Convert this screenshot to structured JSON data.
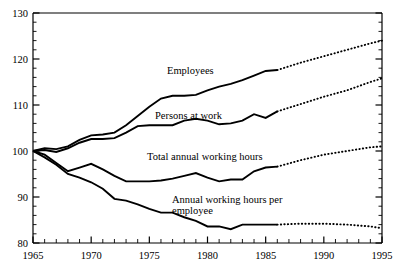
{
  "chart_data": {
    "type": "line",
    "title": "",
    "subtitle": "",
    "xlabel": "",
    "ylabel": "",
    "xlim": [
      1965,
      1995
    ],
    "ylim": [
      80,
      130
    ],
    "grid": false,
    "legend_position": "inline-annotations",
    "y_ticks_major": [
      80,
      90,
      100,
      110,
      120,
      130
    ],
    "y_ticks_minor_step": 2,
    "x_ticks_major": [
      1965,
      1970,
      1975,
      1980,
      1985,
      1990,
      1995
    ],
    "x_ticks_minor_step": 1,
    "x_tick_labels": [
      "1965",
      "1970",
      "1975",
      "1980",
      "1985",
      "1990",
      "1995"
    ],
    "y_tick_labels": [
      "80",
      "90",
      "100",
      "110",
      "120",
      "130"
    ],
    "index_base_note": "1965 = 100",
    "series": [
      {
        "name": "Employees",
        "label": "Employees",
        "style": "solid-then-dotted",
        "forecast_starts": 1986,
        "x": [
          1965,
          1966,
          1967,
          1968,
          1969,
          1970,
          1971,
          1972,
          1973,
          1974,
          1975,
          1976,
          1977,
          1978,
          1979,
          1980,
          1981,
          1982,
          1983,
          1984,
          1985,
          1986
        ],
        "values": [
          100.0,
          100.6,
          100.4,
          101.0,
          102.4,
          103.4,
          103.6,
          104.0,
          105.6,
          107.6,
          109.6,
          111.4,
          112.0,
          112.0,
          112.2,
          113.2,
          114.0,
          114.6,
          115.4,
          116.4,
          117.4,
          117.6
        ],
        "forecast_x": [
          1986,
          1988,
          1990,
          1992,
          1994,
          1995
        ],
        "forecast_values": [
          117.6,
          119.2,
          120.6,
          122.0,
          123.4,
          124.0
        ]
      },
      {
        "name": "Persons at work",
        "label": "Persons at work",
        "style": "solid-then-dotted",
        "forecast_starts": 1986,
        "x": [
          1965,
          1966,
          1967,
          1968,
          1969,
          1970,
          1971,
          1972,
          1973,
          1974,
          1975,
          1976,
          1977,
          1978,
          1979,
          1980,
          1981,
          1982,
          1983,
          1984,
          1985,
          1986
        ],
        "values": [
          100.0,
          100.2,
          99.8,
          100.6,
          101.8,
          102.6,
          102.6,
          102.8,
          104.0,
          105.4,
          105.6,
          105.6,
          105.6,
          106.6,
          107.0,
          106.6,
          105.8,
          106.0,
          106.6,
          108.0,
          107.2,
          108.6
        ],
        "forecast_x": [
          1986,
          1988,
          1990,
          1992,
          1994,
          1995
        ],
        "forecast_values": [
          108.6,
          110.2,
          111.8,
          113.2,
          115.0,
          115.8
        ]
      },
      {
        "name": "Total annual working hours",
        "label": "Total annual working hours",
        "style": "solid-then-dotted",
        "forecast_starts": 1986,
        "x": [
          1965,
          1966,
          1967,
          1968,
          1969,
          1970,
          1971,
          1972,
          1973,
          1974,
          1975,
          1976,
          1977,
          1978,
          1979,
          1980,
          1981,
          1982,
          1983,
          1984,
          1985,
          1986
        ],
        "values": [
          100.0,
          99.2,
          97.4,
          95.6,
          96.4,
          97.2,
          96.0,
          94.6,
          93.4,
          93.4,
          93.4,
          93.6,
          94.0,
          94.6,
          95.2,
          94.2,
          93.4,
          93.8,
          93.8,
          95.6,
          96.4,
          96.6
        ],
        "forecast_x": [
          1986,
          1988,
          1990,
          1992,
          1994,
          1995
        ],
        "forecast_values": [
          96.6,
          98.0,
          99.2,
          100.0,
          100.8,
          101.0
        ]
      },
      {
        "name": "Annual working hours per employee",
        "label": "Annual working hours per employee",
        "style": "solid-then-dotted",
        "forecast_starts": 1986,
        "x": [
          1965,
          1966,
          1967,
          1968,
          1969,
          1970,
          1971,
          1972,
          1973,
          1974,
          1975,
          1976,
          1977,
          1978,
          1979,
          1980,
          1981,
          1982,
          1983,
          1984,
          1985,
          1986
        ],
        "values": [
          100.0,
          98.6,
          97.0,
          95.0,
          94.2,
          93.2,
          91.8,
          89.6,
          89.2,
          88.4,
          87.4,
          86.6,
          86.6,
          85.6,
          84.8,
          83.6,
          83.6,
          83.0,
          84.0,
          84.0,
          84.0,
          84.0
        ],
        "forecast_x": [
          1986,
          1988,
          1990,
          1992,
          1994,
          1995
        ],
        "forecast_values": [
          84.0,
          84.2,
          84.2,
          84.0,
          83.6,
          83.2
        ]
      }
    ],
    "annotations": [
      {
        "id": "employees",
        "text": "Employees",
        "x_px": 167,
        "y_px": 74
      },
      {
        "id": "persons-at-work",
        "text": "Persons at work",
        "x_px": 155,
        "y_px": 119
      },
      {
        "id": "total-annual-working-hours",
        "text": "Total annual working hours",
        "x_px": 147,
        "y_px": 160
      },
      {
        "id": "annual-working-hours-per-employee-l1",
        "text": "Annual working hours per",
        "x_px": 172,
        "y_px": 203
      },
      {
        "id": "annual-working-hours-per-employee-l2",
        "text": "employee",
        "x_px": 172,
        "y_px": 214
      }
    ],
    "colors": {
      "axis": "#000000",
      "series": "#000000",
      "background": "#ffffff"
    }
  }
}
